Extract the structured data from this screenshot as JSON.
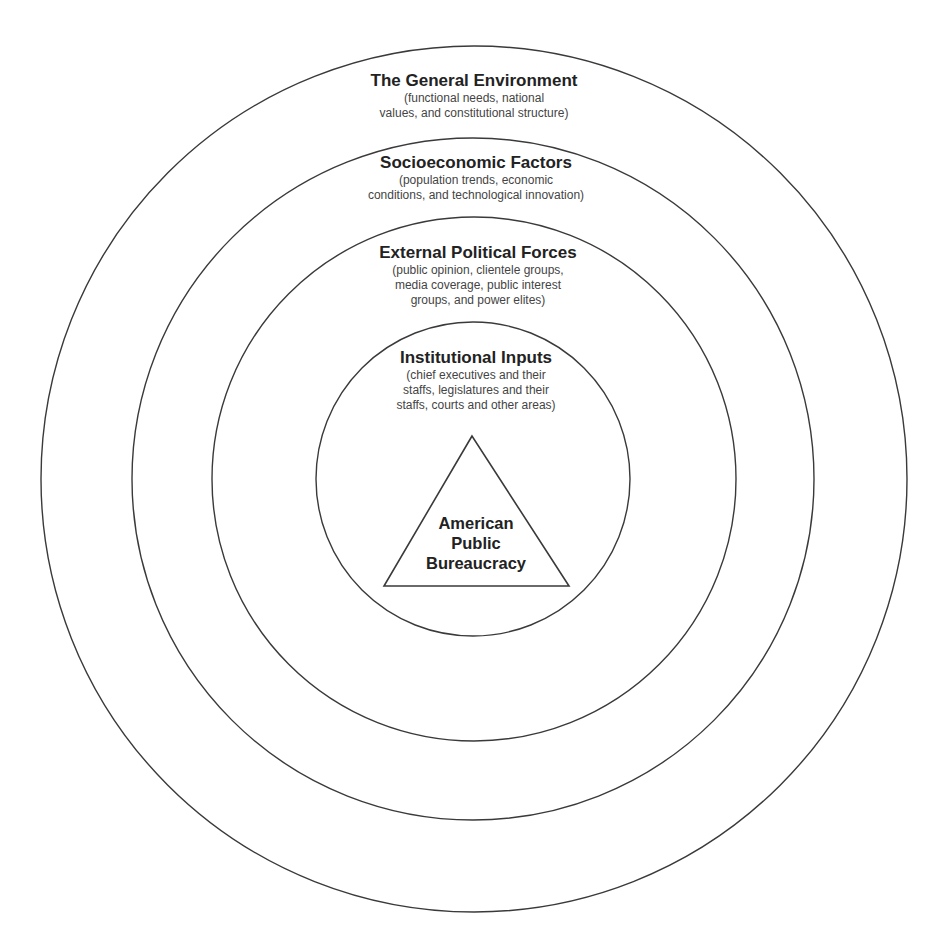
{
  "diagram": {
    "type": "concentric-circles",
    "colors": {
      "stroke": "#3a3a3a",
      "background": "#ffffff",
      "text": "#222222"
    },
    "layers": [
      {
        "title": "The General Environment",
        "description": [
          "(functional needs, national",
          "values, and constitutional structure)"
        ]
      },
      {
        "title": "Socioeconomic Factors",
        "description": [
          "(population trends, economic",
          "conditions, and technological innovation)"
        ]
      },
      {
        "title": "External Political Forces",
        "description": [
          "(public opinion, clientele groups,",
          "media coverage, public interest",
          "groups, and power elites)"
        ]
      },
      {
        "title": "Institutional Inputs",
        "description": [
          "(chief executives and their",
          "staffs, legislatures and their",
          "staffs, courts and other areas)"
        ]
      }
    ],
    "center": {
      "shape": "triangle",
      "lines": [
        "American",
        "Public",
        "Bureaucracy"
      ]
    }
  }
}
